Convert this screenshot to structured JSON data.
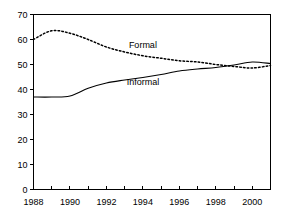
{
  "chart_data": {
    "type": "line",
    "title": "",
    "subtitle": "",
    "xlabel": "",
    "ylabel": "",
    "xlim": [
      1988,
      2001
    ],
    "ylim": [
      0,
      70
    ],
    "grid": false,
    "legend_position": "inline-annotations",
    "x_tick_labels": [
      "1988",
      "1990",
      "1992",
      "1994",
      "1996",
      "1998",
      "2000"
    ],
    "x_tick_values": [
      1988,
      1990,
      1992,
      1994,
      1996,
      1998,
      2000
    ],
    "x_minor_ticks": [
      1989,
      1991,
      1993,
      1995,
      1997,
      1999,
      2001
    ],
    "y_tick_labels": [
      "0",
      "10",
      "20",
      "30",
      "40",
      "50",
      "60",
      "70"
    ],
    "y_tick_values": [
      0,
      10,
      20,
      30,
      40,
      50,
      60,
      70
    ],
    "x": [
      1988,
      1989,
      1990,
      1991,
      1992,
      1993,
      1994,
      1995,
      1996,
      1997,
      1998,
      1999,
      2000,
      2001
    ],
    "series": [
      {
        "name": "Formal",
        "style": "dotted",
        "color": "#000000",
        "label_x": 1994.0,
        "label_y": 56.5,
        "values": [
          60.0,
          63.5,
          62.5,
          60.0,
          57.0,
          55.0,
          53.5,
          52.5,
          51.5,
          51.0,
          50.0,
          49.2,
          48.6,
          49.6
        ]
      },
      {
        "name": "Informal",
        "style": "solid",
        "color": "#000000",
        "label_x": 1994.0,
        "label_y": 42.0,
        "values": [
          37.0,
          37.0,
          37.4,
          40.5,
          42.6,
          43.8,
          44.8,
          46.0,
          47.4,
          48.2,
          48.8,
          49.8,
          51.0,
          50.4
        ]
      }
    ],
    "annotations": [
      {
        "text": "Formal",
        "x": 1994.0,
        "y": 56.5
      },
      {
        "text": "Informal",
        "x": 1994.0,
        "y": 42.0
      }
    ]
  }
}
